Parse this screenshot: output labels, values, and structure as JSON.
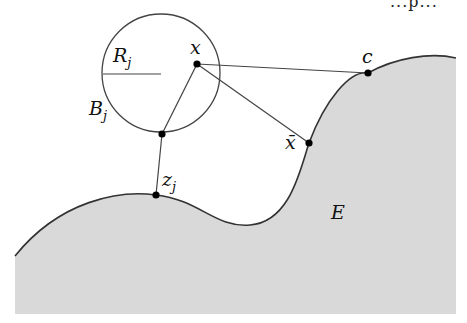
{
  "figure": {
    "type": "geometric-diagram",
    "top_text_fragment": "...p...",
    "region": {
      "label": "E",
      "fill": "#d9d9d9",
      "stroke": "#333333"
    },
    "ball": {
      "label_main": "B",
      "label_sub": "j",
      "radius_label_main": "R",
      "radius_label_sub": "j",
      "center": [
        161,
        73
      ],
      "radius": 59
    },
    "points": {
      "x": {
        "label": "x",
        "pos": [
          197,
          64
        ]
      },
      "c": {
        "label": "c",
        "pos": [
          368,
          73
        ]
      },
      "xbar": {
        "label": "x̄",
        "pos": [
          309,
          143
        ]
      },
      "zj": {
        "label_main": "z",
        "label_sub": "j",
        "pos": [
          156,
          195
        ]
      },
      "ball_bottom": {
        "pos": [
          162,
          134
        ]
      }
    }
  }
}
